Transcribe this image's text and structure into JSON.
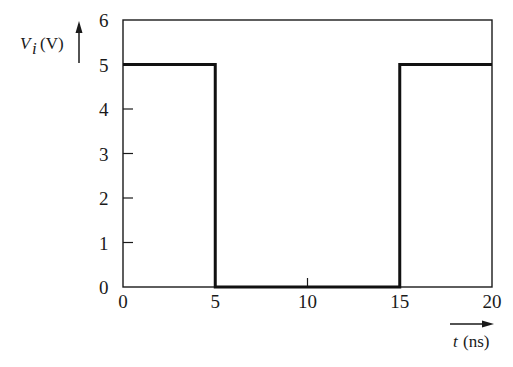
{
  "chart_data": {
    "type": "line",
    "title": "",
    "xlabel": "t (ns)",
    "ylabel": "V_i (V)",
    "xlabel_parts": {
      "var": "t",
      "unit": "(ns)"
    },
    "ylabel_parts": {
      "var": "V",
      "sub": "i",
      "unit": "(V)"
    },
    "xlim": [
      0,
      20
    ],
    "ylim": [
      0,
      6
    ],
    "xticks": [
      0,
      5,
      10,
      15,
      20
    ],
    "yticks": [
      0,
      1,
      2,
      3,
      4,
      5,
      6
    ],
    "grid": false,
    "legend": null,
    "series": [
      {
        "name": "V_i",
        "step": true,
        "x": [
          0,
          5,
          5,
          15,
          15,
          20
        ],
        "y": [
          5,
          5,
          0,
          0,
          5,
          5
        ]
      }
    ]
  },
  "colors": {
    "line": "#111111",
    "axes": "#1a1a1a",
    "background": "#ffffff"
  }
}
